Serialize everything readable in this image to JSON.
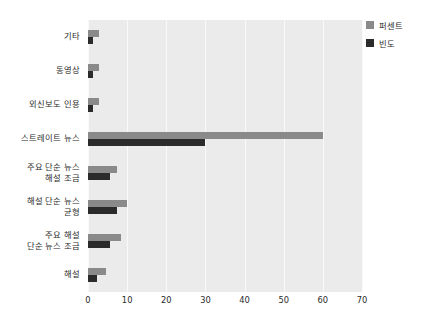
{
  "legend": {
    "position": "top-right",
    "items": [
      {
        "label": "퍼센트",
        "color": "#8a8a8a",
        "swatch_name": "legend-swatch-percent"
      },
      {
        "label": "빈도",
        "color": "#2b2b2b",
        "swatch_name": "legend-swatch-frequency"
      }
    ]
  },
  "axis": {
    "x_ticks": [
      "0",
      "10",
      "20",
      "30",
      "40",
      "50",
      "60",
      "70"
    ]
  },
  "chart_data": {
    "type": "bar",
    "orientation": "horizontal",
    "grouped": true,
    "title": "",
    "subtitle": "",
    "xlabel": "",
    "ylabel": "",
    "xlim": [
      0,
      70
    ],
    "xticks": [
      0,
      10,
      20,
      30,
      40,
      50,
      60,
      70
    ],
    "grid": "vertical-gridlines-only",
    "legend_position": "top-right",
    "plot_background": "#ebebeb",
    "categories": [
      "기타",
      "동영상",
      "외신보도 인용",
      "스트레이트 뉴스",
      "주요 단순 뉴스\n해설 조금",
      "해설 단순 뉴스\n균형",
      "주요 해설\n단순 뉴스 조금",
      "해설"
    ],
    "category_lines": [
      [
        "기타"
      ],
      [
        "동영상"
      ],
      [
        "외신보도 인용"
      ],
      [
        "스트레이트 뉴스"
      ],
      [
        "주요 단순 뉴스",
        "해설 조금"
      ],
      [
        "해설 단순 뉴스",
        "균형"
      ],
      [
        "주요 해설",
        "단순 뉴스 조금"
      ],
      [
        "해설"
      ]
    ],
    "series": [
      {
        "name": "퍼센트",
        "color": "#8a8a8a",
        "values": [
          2.7,
          2.7,
          2.7,
          60.0,
          7.5,
          10.0,
          8.5,
          4.7
        ]
      },
      {
        "name": "빈도",
        "color": "#2b2b2b",
        "values": [
          1.3,
          1.3,
          1.3,
          30.0,
          5.5,
          7.5,
          5.5,
          2.2
        ]
      }
    ]
  }
}
